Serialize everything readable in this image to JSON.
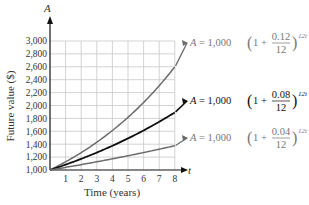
{
  "chart_data": {
    "type": "line",
    "title": "",
    "xlabel": "Time (years)",
    "ylabel": "Future value ($)",
    "x_axis_var": "t",
    "y_axis_var": "A",
    "xlim": [
      0,
      8
    ],
    "ylim": [
      1000,
      3000
    ],
    "x_ticks": [
      1,
      2,
      3,
      4,
      5,
      6,
      7,
      8
    ],
    "y_ticks": [
      "1,000",
      "1,200",
      "1,400",
      "1,600",
      "1,800",
      "2,000",
      "2,200",
      "2,400",
      "2,600",
      "2,800",
      "3,000"
    ],
    "grid": true,
    "legend_position": "right (inline labels)",
    "x": [
      0,
      1,
      2,
      3,
      4,
      5,
      6,
      7,
      8,
      8.9
    ],
    "series": [
      {
        "name": "A = 1,000(1 + 0.12/12)^{12t}",
        "rate": 0.12,
        "color": "#6b6b6b",
        "values": [
          1000,
          1127,
          1270,
          1431,
          1612,
          1817,
          2047,
          2307,
          2599,
          2899
        ]
      },
      {
        "name": "A = 1,000(1 + 0.08/12)^{12t}",
        "rate": 0.08,
        "color": "#111111",
        "values": [
          1000,
          1083,
          1173,
          1270,
          1376,
          1490,
          1614,
          1747,
          1892,
          2031
        ]
      },
      {
        "name": "A = 1,000(1 + 0.04/12)^{12t}",
        "rate": 0.04,
        "color": "#6b6b6b",
        "values": [
          1000,
          1041,
          1083,
          1127,
          1173,
          1221,
          1271,
          1323,
          1377,
          1427
        ]
      }
    ]
  },
  "labels": {
    "y_var": "A",
    "x_var": "t",
    "ylabel": "Future value ($)",
    "xlabel": "Time (years)",
    "eq_prefix": "A",
    "eq_equals": " = 1,000",
    "eq_one_plus": "1 + ",
    "eq_denominator": "12",
    "eq_exponent": "12t",
    "eq_rates": [
      "0.12",
      "0.08",
      "0.04"
    ]
  }
}
